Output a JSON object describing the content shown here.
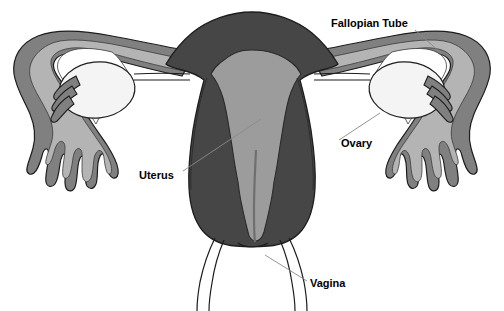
{
  "figure": {
    "background_color": "#ffffff",
    "width": 504,
    "height": 311
  },
  "palette": {
    "myometrium_dark": "#464646",
    "endometrium_gray": "#9c9c9c",
    "tube_wall_gray": "#808080",
    "tube_lumen_light": "#b4b4b4",
    "ovary_white": "#f4f4f4",
    "outline_black": "#1d1d1d",
    "leader_line_gray": "#8a8a8a",
    "label_text_color": "#000000"
  },
  "labels": [
    {
      "id": "fallopian-tube",
      "text": "Fallopian Tube",
      "x": 331,
      "y": 27,
      "anchor": "start",
      "leader": {
        "x1": 415,
        "y1": 30,
        "x2": 441,
        "y2": 53
      }
    },
    {
      "id": "ovary",
      "text": "Ovary",
      "x": 341,
      "y": 147,
      "anchor": "start",
      "leader": {
        "x1": 339,
        "y1": 140,
        "x2": 380,
        "y2": 113
      }
    },
    {
      "id": "uterus",
      "text": "Uterus",
      "x": 139,
      "y": 179,
      "anchor": "start",
      "leader": {
        "x1": 183,
        "y1": 171,
        "x2": 261,
        "y2": 119
      }
    },
    {
      "id": "vagina",
      "text": "Vagina",
      "x": 310,
      "y": 287,
      "anchor": "start",
      "leader": {
        "x1": 307,
        "y1": 281,
        "x2": 265,
        "y2": 255
      }
    }
  ],
  "structures": [
    {
      "id": "uterus-body",
      "name": "Uterus (myometrium)",
      "fill": "#464646"
    },
    {
      "id": "uterine-cavity",
      "name": "Endometrial cavity",
      "fill": "#9c9c9c"
    },
    {
      "id": "fallopian-tube-left",
      "name": "Left fallopian tube",
      "fill": "#808080"
    },
    {
      "id": "fallopian-tube-right",
      "name": "Right fallopian tube",
      "fill": "#808080"
    },
    {
      "id": "fimbriae-left",
      "name": "Left fimbriae",
      "fill": "#808080"
    },
    {
      "id": "fimbriae-right",
      "name": "Right fimbriae",
      "fill": "#808080"
    },
    {
      "id": "ovary-left",
      "name": "Left ovary",
      "fill": "#f4f4f4"
    },
    {
      "id": "ovary-right",
      "name": "Right ovary",
      "fill": "#f4f4f4"
    },
    {
      "id": "cervix",
      "name": "Cervix",
      "fill": "#464646"
    },
    {
      "id": "vaginal-canal",
      "name": "Vaginal canal",
      "fill": "none"
    }
  ]
}
